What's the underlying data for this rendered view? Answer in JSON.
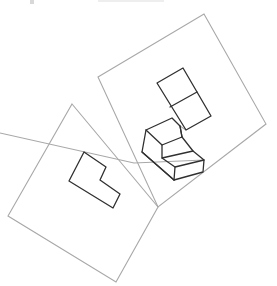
{
  "diagram": {
    "colors": {
      "plane_stroke": "#a8a8a8",
      "shape_stroke": "#303030",
      "background": "#ffffff"
    },
    "planes": [
      {
        "name": "upper-right-plane",
        "points": [
          [
            98,
            77
          ],
          [
            204,
            14
          ],
          [
            266,
            124
          ],
          [
            158,
            207
          ]
        ]
      },
      {
        "name": "lower-left-plane",
        "points": [
          [
            72,
            104
          ],
          [
            158,
            207
          ],
          [
            116,
            282
          ],
          [
            8,
            216
          ]
        ]
      }
    ],
    "shapes": {
      "l_outline": {
        "name": "l-shape-front-view",
        "points": [
          [
            84,
            152
          ],
          [
            106,
            167
          ],
          [
            100,
            180
          ],
          [
            120,
            194
          ],
          [
            113,
            208
          ],
          [
            69,
            181
          ]
        ]
      },
      "top_view": {
        "name": "two-cell-top-view",
        "outer": [
          [
            157,
            83
          ],
          [
            183,
            68
          ],
          [
            211,
            116
          ],
          [
            186,
            130
          ]
        ],
        "divider": [
          [
            170,
            107
          ],
          [
            197,
            92
          ]
        ]
      },
      "step_block": {
        "name": "isometric-step-block",
        "paths": [
          [
            [
              146,
              130
            ],
            [
              172,
              118
            ],
            [
              180,
              126
            ],
            [
              182,
              137
            ],
            [
              162,
              145
            ],
            [
              146,
              130
            ]
          ],
          [
            [
              146,
              130
            ],
            [
              142,
              152
            ],
            [
              174,
              180
            ],
            [
              203,
              172
            ],
            [
              204,
              160
            ],
            [
              193,
              151
            ],
            [
              182,
              137
            ]
          ],
          [
            [
              162,
              145
            ],
            [
              162,
              158
            ],
            [
              193,
              151
            ]
          ],
          [
            [
              162,
              158
            ],
            [
              175,
              167
            ],
            [
              204,
              160
            ]
          ],
          [
            [
              175,
              167
            ],
            [
              174,
              180
            ]
          ],
          [
            [
              142,
              152
            ],
            [
              174,
              180
            ]
          ],
          [
            [
              180,
              126
            ],
            [
              182,
              137
            ]
          ]
        ]
      },
      "projection_lines": [
        [
          [
            0,
            133
          ],
          [
            134,
            163
          ],
          [
            204,
            160
          ]
        ],
        [
          [
            186,
            130
          ],
          [
            180,
            126
          ]
        ]
      ]
    }
  }
}
